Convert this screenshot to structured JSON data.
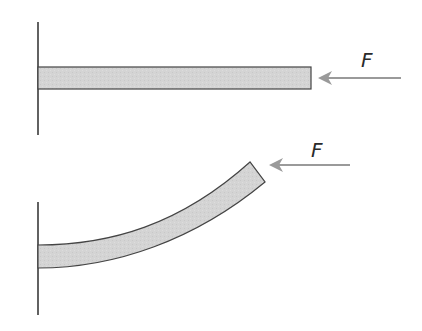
{
  "diagram": {
    "colors": {
      "wall": "#3a3a3a",
      "beam_fill": "#d6d6d6",
      "beam_stroke": "#444444",
      "arrow": "#9a9a9a",
      "label": "#2a2a2a"
    },
    "top": {
      "state": "straight",
      "force_label": "F"
    },
    "bottom": {
      "state": "bent",
      "force_label": "F"
    }
  }
}
